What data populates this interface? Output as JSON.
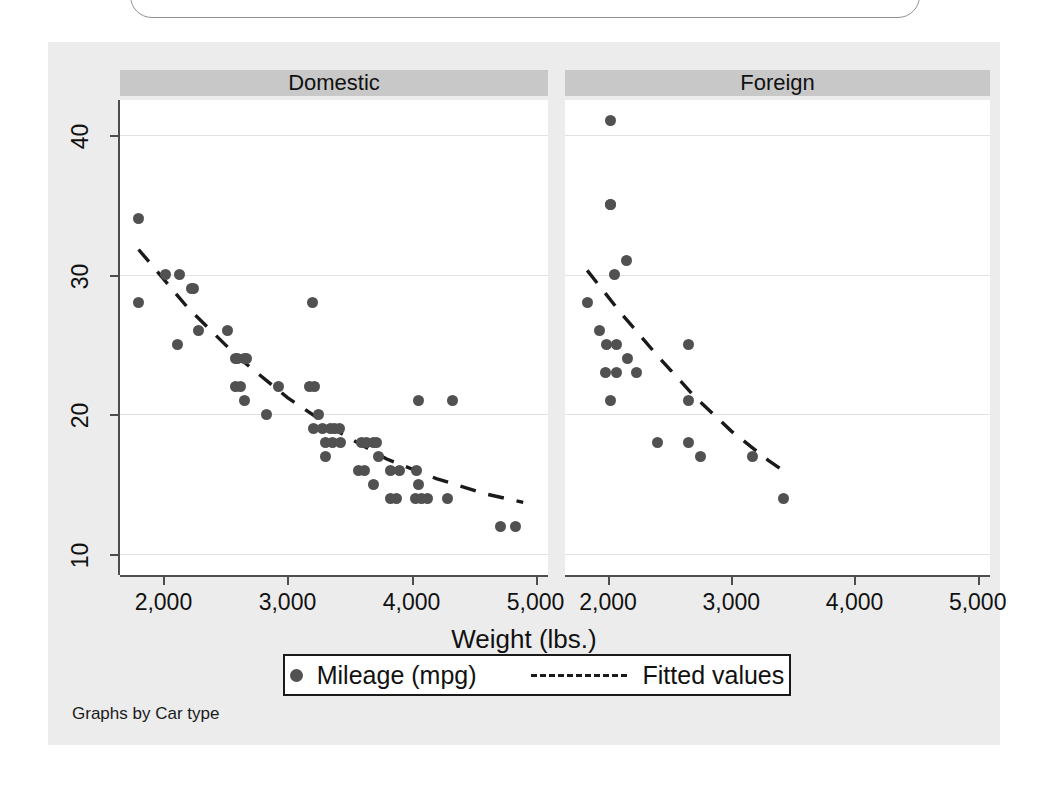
{
  "figure": {
    "background_color": "#ececec",
    "plot_background_color": "#ffffff",
    "panel_header_color": "#c8c8c8",
    "marker_color": "#515151",
    "fit_line_color": "#1a1a1a",
    "footnote": "Graphs by Car type"
  },
  "axis": {
    "x_title": "Weight (lbs.)",
    "x_ticks": [
      "2,000",
      "3,000",
      "4,000",
      "5,000"
    ],
    "x_tick_values": [
      2000,
      3000,
      4000,
      5000
    ],
    "y_ticks": [
      "10",
      "20",
      "30",
      "40"
    ],
    "y_tick_values": [
      10,
      20,
      30,
      40
    ]
  },
  "legend": {
    "marker_label": "Mileage (mpg)",
    "line_label": "Fitted values",
    "marker_icon": "filled-circle-icon",
    "line_icon": "dashed-line-icon"
  },
  "chart_data": {
    "type": "scatter",
    "title": "",
    "xlabel": "Weight (lbs.)",
    "ylabel": "Mileage (mpg)",
    "xlim": [
      1650,
      5100
    ],
    "ylim": [
      8.5,
      42.5
    ],
    "grid": "horizontal",
    "legend_position": "bottom",
    "facet_variable": "Car type",
    "panels": [
      {
        "label": "Domestic",
        "points": [
          {
            "weight": 1800,
            "mpg": 34
          },
          {
            "weight": 1800,
            "mpg": 28
          },
          {
            "weight": 2020,
            "mpg": 30
          },
          {
            "weight": 2130,
            "mpg": 30
          },
          {
            "weight": 2110,
            "mpg": 25
          },
          {
            "weight": 2240,
            "mpg": 29
          },
          {
            "weight": 2230,
            "mpg": 29
          },
          {
            "weight": 2280,
            "mpg": 26
          },
          {
            "weight": 2520,
            "mpg": 26
          },
          {
            "weight": 2580,
            "mpg": 24
          },
          {
            "weight": 2600,
            "mpg": 24
          },
          {
            "weight": 2650,
            "mpg": 24
          },
          {
            "weight": 2670,
            "mpg": 24
          },
          {
            "weight": 2580,
            "mpg": 22
          },
          {
            "weight": 2620,
            "mpg": 22
          },
          {
            "weight": 2650,
            "mpg": 21
          },
          {
            "weight": 2830,
            "mpg": 20
          },
          {
            "weight": 2930,
            "mpg": 22
          },
          {
            "weight": 3180,
            "mpg": 22
          },
          {
            "weight": 3220,
            "mpg": 22
          },
          {
            "weight": 3200,
            "mpg": 28
          },
          {
            "weight": 3250,
            "mpg": 20
          },
          {
            "weight": 3210,
            "mpg": 19
          },
          {
            "weight": 3280,
            "mpg": 19
          },
          {
            "weight": 3350,
            "mpg": 19
          },
          {
            "weight": 3380,
            "mpg": 19
          },
          {
            "weight": 3420,
            "mpg": 19
          },
          {
            "weight": 3310,
            "mpg": 18
          },
          {
            "weight": 3360,
            "mpg": 18
          },
          {
            "weight": 3430,
            "mpg": 18
          },
          {
            "weight": 3310,
            "mpg": 17
          },
          {
            "weight": 3600,
            "mpg": 18
          },
          {
            "weight": 3640,
            "mpg": 18
          },
          {
            "weight": 3690,
            "mpg": 18
          },
          {
            "weight": 3720,
            "mpg": 18
          },
          {
            "weight": 3730,
            "mpg": 17
          },
          {
            "weight": 3570,
            "mpg": 16
          },
          {
            "weight": 3620,
            "mpg": 16
          },
          {
            "weight": 3690,
            "mpg": 15
          },
          {
            "weight": 3830,
            "mpg": 16
          },
          {
            "weight": 3900,
            "mpg": 16
          },
          {
            "weight": 4040,
            "mpg": 16
          },
          {
            "weight": 4060,
            "mpg": 15
          },
          {
            "weight": 3830,
            "mpg": 14
          },
          {
            "weight": 3880,
            "mpg": 14
          },
          {
            "weight": 4030,
            "mpg": 14
          },
          {
            "weight": 4080,
            "mpg": 14
          },
          {
            "weight": 4130,
            "mpg": 14
          },
          {
            "weight": 4290,
            "mpg": 14
          },
          {
            "weight": 4060,
            "mpg": 21
          },
          {
            "weight": 4330,
            "mpg": 21
          },
          {
            "weight": 4720,
            "mpg": 12
          },
          {
            "weight": 4840,
            "mpg": 12
          }
        ],
        "fit_curve": [
          {
            "weight": 1800,
            "mpg": 31.8
          },
          {
            "weight": 2200,
            "mpg": 27.6
          },
          {
            "weight": 2600,
            "mpg": 24.1
          },
          {
            "weight": 3000,
            "mpg": 21.2
          },
          {
            "weight": 3400,
            "mpg": 18.8
          },
          {
            "weight": 3800,
            "mpg": 16.8
          },
          {
            "weight": 4200,
            "mpg": 15.4
          },
          {
            "weight": 4600,
            "mpg": 14.3
          },
          {
            "weight": 4900,
            "mpg": 13.7
          }
        ]
      },
      {
        "label": "Foreign",
        "points": [
          {
            "weight": 2020,
            "mpg": 41
          },
          {
            "weight": 2020,
            "mpg": 35
          },
          {
            "weight": 2020,
            "mpg": 35
          },
          {
            "weight": 2150,
            "mpg": 31
          },
          {
            "weight": 2050,
            "mpg": 30
          },
          {
            "weight": 1830,
            "mpg": 28
          },
          {
            "weight": 1930,
            "mpg": 26
          },
          {
            "weight": 1990,
            "mpg": 25
          },
          {
            "weight": 2070,
            "mpg": 25
          },
          {
            "weight": 2650,
            "mpg": 25
          },
          {
            "weight": 2160,
            "mpg": 24
          },
          {
            "weight": 1980,
            "mpg": 23
          },
          {
            "weight": 2070,
            "mpg": 23
          },
          {
            "weight": 2230,
            "mpg": 23
          },
          {
            "weight": 2020,
            "mpg": 21
          },
          {
            "weight": 2650,
            "mpg": 21
          },
          {
            "weight": 2400,
            "mpg": 18
          },
          {
            "weight": 2650,
            "mpg": 18
          },
          {
            "weight": 2750,
            "mpg": 17
          },
          {
            "weight": 3170,
            "mpg": 17
          },
          {
            "weight": 3420,
            "mpg": 14
          }
        ],
        "fit_curve": [
          {
            "weight": 1830,
            "mpg": 30.3
          },
          {
            "weight": 2100,
            "mpg": 27.3
          },
          {
            "weight": 2400,
            "mpg": 24.2
          },
          {
            "weight": 2700,
            "mpg": 21.3
          },
          {
            "weight": 3000,
            "mpg": 18.8
          },
          {
            "weight": 3300,
            "mpg": 16.7
          },
          {
            "weight": 3450,
            "mpg": 15.8
          }
        ]
      }
    ]
  }
}
